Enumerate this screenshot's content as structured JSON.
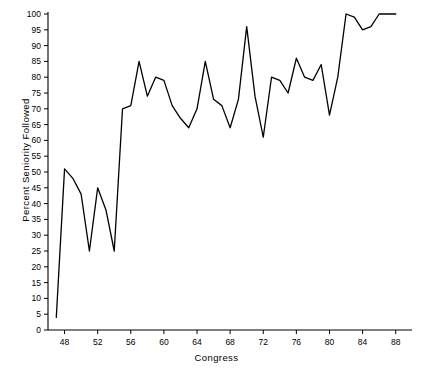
{
  "chart_data": {
    "type": "line",
    "title": "",
    "xlabel": "Congress",
    "ylabel": "Percent Seniority Followed",
    "xlim": [
      46,
      89
    ],
    "ylim": [
      0,
      100
    ],
    "grid": false,
    "legend": null,
    "xticks": [
      48,
      52,
      56,
      60,
      64,
      68,
      72,
      76,
      80,
      84,
      88
    ],
    "yticks": [
      0,
      5,
      10,
      15,
      20,
      25,
      30,
      35,
      40,
      45,
      50,
      55,
      60,
      65,
      70,
      75,
      80,
      85,
      90,
      95,
      100
    ],
    "x": [
      47,
      48,
      49,
      50,
      51,
      52,
      53,
      54,
      55,
      56,
      57,
      58,
      59,
      60,
      61,
      62,
      63,
      64,
      65,
      66,
      67,
      68,
      69,
      70,
      71,
      72,
      73,
      74,
      75,
      76,
      77,
      78,
      79,
      80,
      81,
      82,
      83,
      84,
      85,
      86,
      87,
      88
    ],
    "values": [
      4,
      51,
      48,
      43,
      25,
      45,
      38,
      25,
      70,
      71,
      85,
      74,
      80,
      79,
      71,
      67,
      64,
      70,
      85,
      73,
      71,
      64,
      73,
      96,
      74,
      61,
      80,
      79,
      75,
      86,
      80,
      79,
      84,
      68,
      80,
      100,
      99,
      95,
      96,
      100,
      100,
      100
    ],
    "series": [
      {
        "name": "Percent Seniority Followed",
        "values": [
          4,
          51,
          48,
          43,
          25,
          45,
          38,
          25,
          70,
          71,
          85,
          74,
          80,
          79,
          71,
          67,
          64,
          70,
          85,
          73,
          71,
          64,
          73,
          96,
          74,
          61,
          80,
          79,
          75,
          86,
          80,
          79,
          84,
          68,
          80,
          100,
          99,
          95,
          96,
          100,
          100,
          100
        ],
        "color": "#000000"
      }
    ]
  },
  "axes": {
    "x_tick_labels": [
      "48",
      "52",
      "56",
      "60",
      "64",
      "68",
      "72",
      "76",
      "80",
      "84",
      "88"
    ],
    "y_tick_labels": [
      "0",
      "5",
      "10",
      "15",
      "20",
      "25",
      "30",
      "35",
      "40",
      "45",
      "50",
      "55",
      "60",
      "65",
      "70",
      "75",
      "80",
      "85",
      "90",
      "95",
      "100"
    ],
    "axis_color": "#000000"
  }
}
